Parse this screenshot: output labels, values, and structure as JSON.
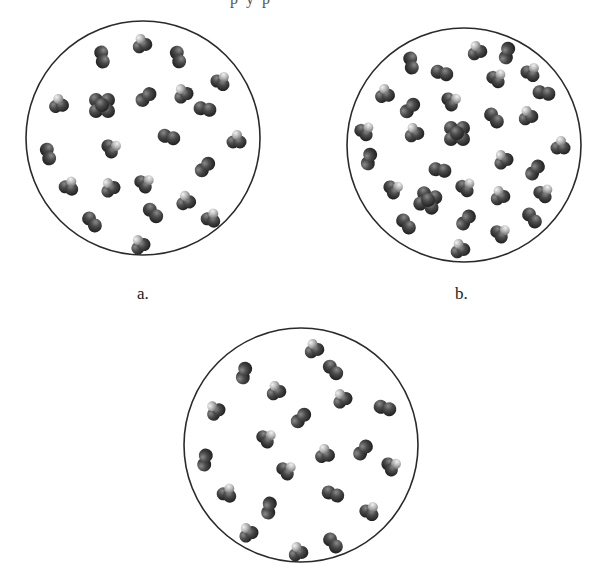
{
  "top_cropped_text": "p y p",
  "colors": {
    "circle_stroke": "#2a2a2a",
    "atom_dark": "#3a3a3a",
    "atom_mid": "#5a5a5a",
    "atom_light": "#bdbdbd",
    "background": "#ffffff"
  },
  "panels": [
    {
      "id": "a",
      "label": "a.",
      "label_pos": [
        137,
        298
      ],
      "circle": {
        "cx": 143,
        "cy": 138,
        "r": 117
      },
      "molecules": [
        {
          "x": 102,
          "y": 57,
          "type": "diatomic",
          "angle": 80
        },
        {
          "x": 141,
          "y": 43,
          "type": "triatomic",
          "angle": -20
        },
        {
          "x": 178,
          "y": 57,
          "type": "diatomic",
          "angle": 75
        },
        {
          "x": 221,
          "y": 80,
          "type": "triatomic",
          "angle": 30
        },
        {
          "x": 58,
          "y": 103,
          "type": "triatomic",
          "angle": -10
        },
        {
          "x": 102,
          "y": 105,
          "type": "cluster4",
          "angle": 0
        },
        {
          "x": 146,
          "y": 97,
          "type": "diatomic",
          "angle": -40
        },
        {
          "x": 182,
          "y": 93,
          "type": "triatomic",
          "angle": -30
        },
        {
          "x": 205,
          "y": 109,
          "type": "diatomic",
          "angle": 10
        },
        {
          "x": 169,
          "y": 137,
          "type": "diatomic",
          "angle": 15
        },
        {
          "x": 236,
          "y": 139,
          "type": "triatomic",
          "angle": 0
        },
        {
          "x": 112,
          "y": 147,
          "type": "triatomic",
          "angle": 60
        },
        {
          "x": 48,
          "y": 154,
          "type": "diatomic",
          "angle": 75
        },
        {
          "x": 205,
          "y": 167,
          "type": "diatomic",
          "angle": -45
        },
        {
          "x": 69,
          "y": 185,
          "type": "triatomic",
          "angle": 20
        },
        {
          "x": 109,
          "y": 187,
          "type": "triatomic",
          "angle": -30
        },
        {
          "x": 145,
          "y": 182,
          "type": "triatomic",
          "angle": 50
        },
        {
          "x": 185,
          "y": 200,
          "type": "triatomic",
          "angle": -15
        },
        {
          "x": 153,
          "y": 213,
          "type": "diatomic",
          "angle": 45
        },
        {
          "x": 92,
          "y": 222,
          "type": "diatomic",
          "angle": 50
        },
        {
          "x": 211,
          "y": 217,
          "type": "triatomic",
          "angle": 20
        },
        {
          "x": 139,
          "y": 244,
          "type": "triatomic",
          "angle": -30
        }
      ]
    },
    {
      "id": "b",
      "label": "b.",
      "label_pos": [
        455,
        298
      ],
      "circle": {
        "cx": 464,
        "cy": 145,
        "r": 117
      },
      "molecules": [
        {
          "x": 476,
          "y": 50,
          "type": "triatomic",
          "angle": -20
        },
        {
          "x": 507,
          "y": 53,
          "type": "diatomic",
          "angle": -75
        },
        {
          "x": 411,
          "y": 63,
          "type": "diatomic",
          "angle": 80
        },
        {
          "x": 442,
          "y": 73,
          "type": "diatomic",
          "angle": 15
        },
        {
          "x": 531,
          "y": 71,
          "type": "triatomic",
          "angle": 30
        },
        {
          "x": 497,
          "y": 77,
          "type": "triatomic",
          "angle": 40
        },
        {
          "x": 384,
          "y": 93,
          "type": "triatomic",
          "angle": -10
        },
        {
          "x": 544,
          "y": 93,
          "type": "diatomic",
          "angle": 10
        },
        {
          "x": 452,
          "y": 100,
          "type": "triatomic",
          "angle": 60
        },
        {
          "x": 410,
          "y": 108,
          "type": "diatomic",
          "angle": -45
        },
        {
          "x": 494,
          "y": 118,
          "type": "diatomic",
          "angle": 50
        },
        {
          "x": 527,
          "y": 115,
          "type": "triatomic",
          "angle": -20
        },
        {
          "x": 365,
          "y": 130,
          "type": "triatomic",
          "angle": 40
        },
        {
          "x": 413,
          "y": 132,
          "type": "triatomic",
          "angle": -20
        },
        {
          "x": 457,
          "y": 133,
          "type": "cluster4",
          "angle": 0
        },
        {
          "x": 560,
          "y": 145,
          "type": "triatomic",
          "angle": 0
        },
        {
          "x": 369,
          "y": 159,
          "type": "diatomic",
          "angle": -75
        },
        {
          "x": 502,
          "y": 159,
          "type": "triatomic",
          "angle": -30
        },
        {
          "x": 440,
          "y": 170,
          "type": "diatomic",
          "angle": 10
        },
        {
          "x": 535,
          "y": 170,
          "type": "diatomic",
          "angle": -50
        },
        {
          "x": 394,
          "y": 188,
          "type": "triatomic",
          "angle": 60
        },
        {
          "x": 466,
          "y": 186,
          "type": "triatomic",
          "angle": 40
        },
        {
          "x": 428,
          "y": 200,
          "type": "cluster4",
          "angle": 20
        },
        {
          "x": 499,
          "y": 195,
          "type": "triatomic",
          "angle": -20
        },
        {
          "x": 544,
          "y": 192,
          "type": "triatomic",
          "angle": 40
        },
        {
          "x": 406,
          "y": 224,
          "type": "diatomic",
          "angle": 50
        },
        {
          "x": 466,
          "y": 220,
          "type": "diatomic",
          "angle": -50
        },
        {
          "x": 532,
          "y": 218,
          "type": "diatomic",
          "angle": 50
        },
        {
          "x": 501,
          "y": 232,
          "type": "triatomic",
          "angle": 50
        },
        {
          "x": 459,
          "y": 248,
          "type": "triatomic",
          "angle": -20
        }
      ]
    },
    {
      "id": "c",
      "label": "",
      "circle": {
        "cx": 301,
        "cy": 445,
        "r": 117
      },
      "molecules": [
        {
          "x": 313,
          "y": 348,
          "type": "triatomic",
          "angle": -20
        },
        {
          "x": 333,
          "y": 370,
          "type": "diatomic",
          "angle": 45
        },
        {
          "x": 244,
          "y": 373,
          "type": "diatomic",
          "angle": -75
        },
        {
          "x": 275,
          "y": 390,
          "type": "triatomic",
          "angle": -20
        },
        {
          "x": 341,
          "y": 398,
          "type": "triatomic",
          "angle": -30
        },
        {
          "x": 214,
          "y": 410,
          "type": "triatomic",
          "angle": -40
        },
        {
          "x": 385,
          "y": 408,
          "type": "diatomic",
          "angle": 15
        },
        {
          "x": 301,
          "y": 418,
          "type": "diatomic",
          "angle": -45
        },
        {
          "x": 267,
          "y": 437,
          "type": "triatomic",
          "angle": 50
        },
        {
          "x": 324,
          "y": 453,
          "type": "triatomic",
          "angle": -10
        },
        {
          "x": 363,
          "y": 450,
          "type": "diatomic",
          "angle": -50
        },
        {
          "x": 205,
          "y": 460,
          "type": "diatomic",
          "angle": -80
        },
        {
          "x": 392,
          "y": 465,
          "type": "triatomic",
          "angle": 60
        },
        {
          "x": 287,
          "y": 469,
          "type": "triatomic",
          "angle": 50
        },
        {
          "x": 227,
          "y": 492,
          "type": "triatomic",
          "angle": 20
        },
        {
          "x": 333,
          "y": 494,
          "type": "diatomic",
          "angle": 20
        },
        {
          "x": 269,
          "y": 508,
          "type": "diatomic",
          "angle": -80
        },
        {
          "x": 370,
          "y": 510,
          "type": "triatomic",
          "angle": 30
        },
        {
          "x": 247,
          "y": 532,
          "type": "triatomic",
          "angle": -30
        },
        {
          "x": 297,
          "y": 551,
          "type": "triatomic",
          "angle": -20
        },
        {
          "x": 333,
          "y": 543,
          "type": "diatomic",
          "angle": 50
        }
      ]
    }
  ]
}
